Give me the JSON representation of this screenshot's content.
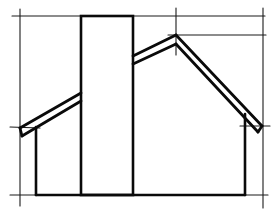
{
  "drawing": {
    "subject": "house-silhouette-sketch",
    "colors": {
      "background": "#ffffff",
      "ink": "#0a0a0a",
      "guide_ink": "#1a1a1a"
    },
    "guides": [
      {
        "name": "top-guide-line",
        "x1": 12,
        "y1": 16,
        "x2": 265,
        "y2": 16
      },
      {
        "name": "second-guide-line",
        "x1": 168,
        "y1": 35,
        "x2": 266,
        "y2": 35
      },
      {
        "name": "bottom-guide-line",
        "x1": 10,
        "y1": 195,
        "x2": 268,
        "y2": 195
      },
      {
        "name": "left-guide-line",
        "x1": 20,
        "y1": 9,
        "x2": 20,
        "y2": 206
      },
      {
        "name": "right-guide-line",
        "x1": 263,
        "y1": 8,
        "x2": 263,
        "y2": 208
      },
      {
        "name": "peak-guide-line",
        "x1": 176,
        "y1": 8,
        "x2": 176,
        "y2": 55
      },
      {
        "name": "left-eave-guide-line",
        "x1": 10,
        "y1": 127,
        "x2": 40,
        "y2": 128
      },
      {
        "name": "right-eave-guide-line",
        "x1": 240,
        "y1": 126,
        "x2": 270,
        "y2": 126
      }
    ],
    "chimney": {
      "x": 81,
      "y": 16,
      "width": 52,
      "height": 179
    },
    "walls": [
      {
        "name": "left-wall",
        "x1": 36,
        "y1": 127,
        "x2": 36,
        "y2": 195
      },
      {
        "name": "right-wall",
        "x1": 245,
        "y1": 114,
        "x2": 245,
        "y2": 195
      },
      {
        "name": "floor-line",
        "x1": 36,
        "y1": 195,
        "x2": 245,
        "y2": 195
      }
    ],
    "roof_lines": [
      {
        "name": "left-roof-outer",
        "points": "20,128 81,93"
      },
      {
        "name": "left-roof-inner",
        "points": "22,136 81,101"
      },
      {
        "name": "left-eave-tip",
        "points": "20,128 22,136"
      },
      {
        "name": "right-roof-upper-left",
        "points": "133,56 176,35"
      },
      {
        "name": "right-roof-lower-left",
        "points": "133,64 176,44"
      },
      {
        "name": "right-roof-upper-right",
        "points": "176,35 262,126"
      },
      {
        "name": "right-roof-lower-right",
        "points": "176,44 258,132"
      },
      {
        "name": "right-eave-tip",
        "points": "262,126 258,132"
      }
    ]
  }
}
